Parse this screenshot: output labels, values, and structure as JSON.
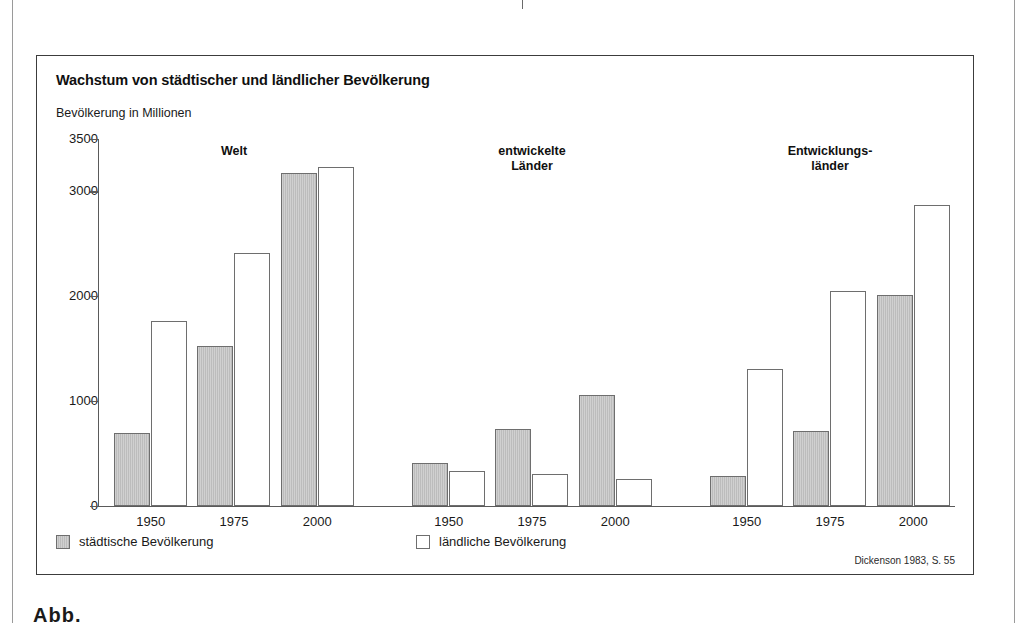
{
  "page": {
    "cut_text_top": "städten.",
    "cut_text_bottom": "Abb.",
    "background": "#ffffff"
  },
  "figure": {
    "title": "Wachstum von städtischer und ländlicher Bevölkerung",
    "axis_caption": "Bevölkerung in Millionen",
    "source": "Dickenson 1983, S. 55",
    "border_color": "#3c3c3c"
  },
  "legend": {
    "position": "bottom-left",
    "items": [
      {
        "label": "städtische Bevölkerung",
        "key": "urban",
        "color": "#bcbcbc"
      },
      {
        "label": "ländliche Bevölkerung",
        "key": "rural",
        "color": "#ffffff"
      }
    ]
  },
  "chart_data": {
    "type": "bar",
    "title": "Wachstum von städtischer und ländlicher Bevölkerung",
    "subtitle": "",
    "xlabel": "",
    "ylabel": "Bevölkerung in Millionen",
    "ylim": [
      0,
      3500
    ],
    "yticks": [
      0,
      1000,
      2000,
      3000,
      3500
    ],
    "ytick_labels": [
      "0",
      "1000",
      "2000",
      "3000",
      "3500"
    ],
    "grid": false,
    "legend_position": "bottom-left",
    "source": "Dickenson 1983, S. 55",
    "categories": [
      "1950",
      "1975",
      "2000"
    ],
    "groups": [
      {
        "name": "Welt",
        "label": "Welt",
        "series": [
          {
            "name": "städtische Bevölkerung",
            "key": "urban",
            "values": [
              700,
              1525,
              3175
            ]
          },
          {
            "name": "ländliche Bevölkerung",
            "key": "rural",
            "values": [
              1765,
              2410,
              3230
            ]
          }
        ]
      },
      {
        "name": "entwickelte Länder",
        "label": "entwickelte\nLänder",
        "series": [
          {
            "name": "städtische Bevölkerung",
            "key": "urban",
            "values": [
              410,
              730,
              1060
            ]
          },
          {
            "name": "ländliche Bevölkerung",
            "key": "rural",
            "values": [
              335,
              305,
              255
            ]
          }
        ]
      },
      {
        "name": "Entwicklungsländer",
        "label": "Entwicklungs-\nländer",
        "series": [
          {
            "name": "städtische Bevölkerung",
            "key": "urban",
            "values": [
              285,
              720,
              2010
            ]
          },
          {
            "name": "ländliche Bevölkerung",
            "key": "rural",
            "values": [
              1305,
              2050,
              2870
            ]
          }
        ]
      }
    ]
  }
}
